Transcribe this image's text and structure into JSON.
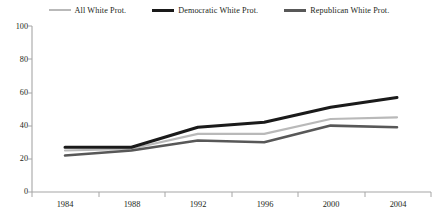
{
  "chart_data": {
    "type": "line",
    "title": "",
    "subtitle": "",
    "xlabel": "",
    "ylabel": "",
    "categories": [
      "1984",
      "1988",
      "1992",
      "1996",
      "2000",
      "2004"
    ],
    "x": [
      1984,
      1988,
      1992,
      1996,
      2000,
      2004
    ],
    "ylim": [
      0,
      100
    ],
    "yticks": [
      0,
      20,
      40,
      60,
      80,
      100
    ],
    "ytick_labels": [
      "0",
      "20",
      "40",
      "60",
      "80",
      "100"
    ],
    "xtick_labels": [
      "1984",
      "1988",
      "1992",
      "1996",
      "2000",
      "2004"
    ],
    "grid": false,
    "legend_position": "top",
    "series": [
      {
        "name": "All White Prot.",
        "values": [
          25,
          26,
          35,
          35,
          44,
          45
        ],
        "color": "#b9b9b9",
        "width": 2.2
      },
      {
        "name": "Democratic White Prot.",
        "values": [
          27,
          27,
          39,
          42,
          51,
          57
        ],
        "color": "#1a1a1a",
        "width": 3.0
      },
      {
        "name": "Republican White Prot.",
        "values": [
          22,
          25,
          31,
          30,
          40,
          39
        ],
        "color": "#585858",
        "width": 2.6
      }
    ]
  },
  "legend": {
    "items": [
      {
        "label": "All White Prot.",
        "swatch": "line-swatch-light-gray"
      },
      {
        "label": "Democratic White Prot.",
        "swatch": "line-swatch-black"
      },
      {
        "label": "Republican White Prot.",
        "swatch": "line-swatch-dark-gray"
      }
    ]
  },
  "axes": {
    "y": {
      "labels": [
        "100",
        "80",
        "60",
        "40",
        "20",
        "0"
      ]
    },
    "x": {
      "labels": [
        "1984",
        "1988",
        "1992",
        "1996",
        "2000",
        "2004"
      ]
    }
  },
  "colors": {
    "axis": "#a6a6a6",
    "text": "#231f20",
    "background": "#ffffff",
    "series_all": "#b9b9b9",
    "series_democratic": "#1a1a1a",
    "series_republican": "#585858"
  }
}
